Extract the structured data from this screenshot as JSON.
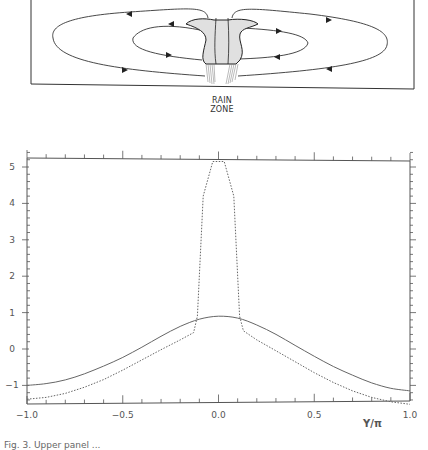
{
  "schematic": {
    "label_line1": "RAIN",
    "label_line2": "ZONE",
    "description": "Two pairs of closed circulation cells flanking a central shaded convective tower with rain below"
  },
  "caption": "Fig. 3. Upper panel ...",
  "chart_data": {
    "type": "line",
    "title": "",
    "xlabel": "Y/π",
    "ylabel": "",
    "xlim": [
      -1.0,
      1.0
    ],
    "ylim": [
      -1.5,
      5.5
    ],
    "x_ticks": [
      "-1.0",
      "-0.5",
      "0.0",
      "0.5",
      "1.0"
    ],
    "y_ticks": [
      "-1",
      "0",
      "1",
      "2",
      "3",
      "4",
      "5"
    ],
    "grid": false,
    "legend": null,
    "series": [
      {
        "name": "solid",
        "style": "solid",
        "x": [
          -1.0,
          -0.9,
          -0.8,
          -0.7,
          -0.6,
          -0.5,
          -0.4,
          -0.3,
          -0.2,
          -0.1,
          0.0,
          0.1,
          0.2,
          0.3,
          0.4,
          0.5,
          0.6,
          0.7,
          0.8,
          0.9,
          1.0
        ],
        "y": [
          -1.0,
          -0.95,
          -0.85,
          -0.68,
          -0.47,
          -0.23,
          0.05,
          0.35,
          0.62,
          0.82,
          0.9,
          0.85,
          0.66,
          0.4,
          0.1,
          -0.2,
          -0.48,
          -0.72,
          -0.93,
          -1.08,
          -1.15
        ]
      },
      {
        "name": "dashed",
        "style": "dashed",
        "x": [
          -1.0,
          -0.9,
          -0.8,
          -0.7,
          -0.6,
          -0.5,
          -0.4,
          -0.3,
          -0.2,
          -0.13,
          -0.11,
          -0.08,
          -0.03,
          0.03,
          0.08,
          0.11,
          0.13,
          0.2,
          0.3,
          0.4,
          0.5,
          0.6,
          0.7,
          0.8,
          0.9,
          1.0
        ],
        "y": [
          -1.38,
          -1.33,
          -1.22,
          -1.05,
          -0.84,
          -0.58,
          -0.3,
          -0.02,
          0.25,
          0.45,
          0.9,
          4.2,
          5.15,
          5.15,
          4.2,
          0.9,
          0.5,
          0.25,
          -0.05,
          -0.35,
          -0.65,
          -0.92,
          -1.15,
          -1.33,
          -1.45,
          -1.52
        ]
      }
    ]
  }
}
